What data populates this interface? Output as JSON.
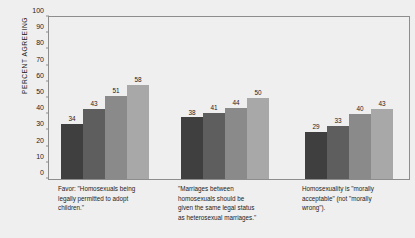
{
  "chart_data": {
    "type": "bar",
    "title": "",
    "subtitle": "",
    "xlabel": "",
    "ylabel": "PERCENT AGREEING",
    "ylim": [
      0,
      100
    ],
    "ytick_values": [
      0,
      10,
      20,
      30,
      40,
      50,
      60,
      70,
      80,
      90,
      100
    ],
    "ytick_labels": [
      "0",
      "10",
      "20",
      "30",
      "40",
      "50",
      "60",
      "70",
      "80",
      "90",
      "100"
    ],
    "grid": false,
    "legend_position": "top",
    "legend_title": "Year of survey:",
    "categories": [
      "Favor: \"Homosexuals being legally permitted to adopt children.\"",
      "\"Marriages between homosexuals should be given the same legal status as heterosexual marriages.\"",
      "Homosexuality is \"morally acceptable\" (not \"morally wrong\")."
    ],
    "category_lines": [
      [
        "Favor: \"Homosexuals being",
        "legally permitted to adopt",
        "children.\""
      ],
      [
        "\"Marriages between",
        "homosexuals should be",
        "given the same legal status",
        "as heterosexual marriages.\""
      ],
      [
        "Homosexuality is \"morally",
        "acceptable\" (not \"morally",
        "wrong\")."
      ]
    ],
    "series": [
      {
        "name": "1995-2000",
        "color": "#3f3f3f",
        "values": [
          34,
          38,
          29
        ]
      },
      {
        "name": "2001-2006",
        "color": "#5e5e5e",
        "values": [
          43,
          41,
          33
        ]
      },
      {
        "name": "2007-2012",
        "color": "#8a8a8a",
        "values": [
          51,
          44,
          40
        ]
      },
      {
        "name": "2013-2019",
        "color": "#a8a8a8",
        "values": [
          58,
          50,
          43
        ]
      }
    ]
  },
  "colors": {
    "background": "#efefef",
    "axis": "#8d8d8d",
    "text": "#1c1c1c"
  }
}
